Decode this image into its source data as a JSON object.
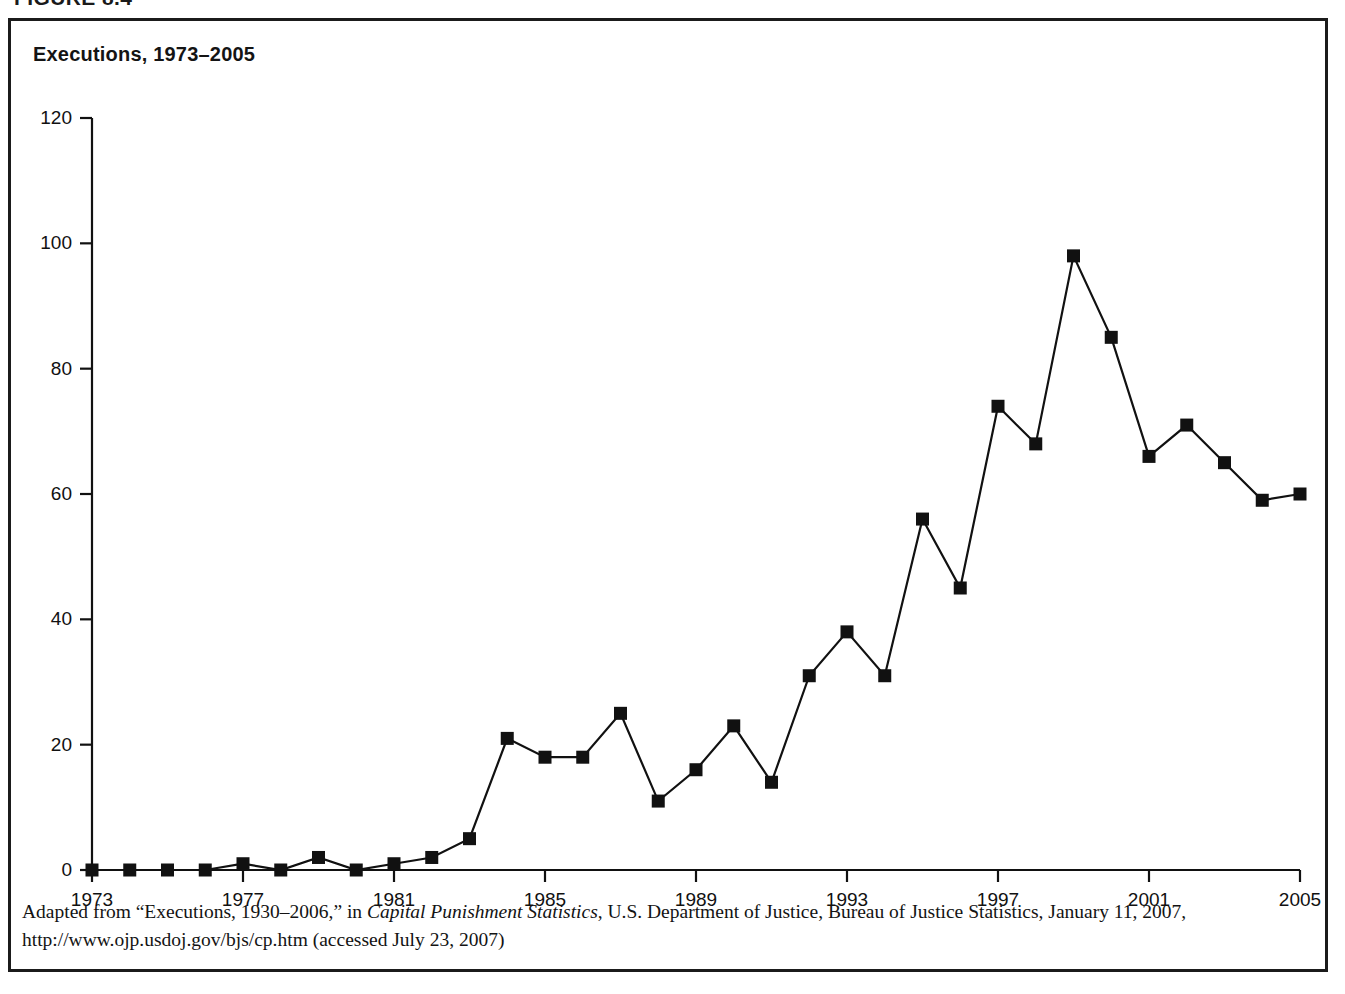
{
  "figure": {
    "number_label": "FIGURE 8.4",
    "title": "Executions, 1973–2005"
  },
  "source_note": {
    "line1_prefix": "Adapted from “Executions, 1930–2006,” in ",
    "line1_italic": "Capital Punishment Statistics",
    "line1_suffix": ", U.S. Department of Justice, Bureau of Justice Statistics, January 11, 2007,",
    "line2": "http://www.ojp.usdoj.gov/bjs/cp.htm (accessed July 23, 2007)"
  },
  "colors": {
    "line": "#111111",
    "marker": "#111111",
    "axis": "#111111",
    "frame": "#1b1b1b",
    "background": "#ffffff"
  },
  "chart_data": {
    "type": "line",
    "title": "Executions, 1973–2005",
    "xlabel": "",
    "ylabel": "",
    "xlim": [
      1973,
      2005
    ],
    "ylim": [
      0,
      120
    ],
    "grid": false,
    "legend": "none",
    "marker": "square",
    "xtick_labels": [
      "1973",
      "1977",
      "1981",
      "1985",
      "1989",
      "1993",
      "1997",
      "2001",
      "2005"
    ],
    "xtick_values": [
      1973,
      1977,
      1981,
      1985,
      1989,
      1993,
      1997,
      2001,
      2005
    ],
    "ytick_labels": [
      "0",
      "20",
      "40",
      "60",
      "80",
      "100",
      "120"
    ],
    "ytick_values": [
      0,
      20,
      40,
      60,
      80,
      100,
      120
    ],
    "x": [
      1973,
      1974,
      1975,
      1976,
      1977,
      1978,
      1979,
      1980,
      1981,
      1982,
      1983,
      1984,
      1985,
      1986,
      1987,
      1988,
      1989,
      1990,
      1991,
      1992,
      1993,
      1994,
      1995,
      1996,
      1997,
      1998,
      1999,
      2000,
      2001,
      2002,
      2003,
      2004,
      2005
    ],
    "values": [
      0,
      0,
      0,
      0,
      1,
      0,
      2,
      0,
      1,
      2,
      5,
      21,
      18,
      18,
      25,
      11,
      16,
      23,
      14,
      31,
      38,
      31,
      56,
      45,
      74,
      68,
      98,
      85,
      66,
      71,
      65,
      59,
      60
    ],
    "series": [
      {
        "name": "Executions",
        "values": [
          0,
          0,
          0,
          0,
          1,
          0,
          2,
          0,
          1,
          2,
          5,
          21,
          18,
          18,
          25,
          11,
          16,
          23,
          14,
          31,
          38,
          31,
          56,
          45,
          74,
          68,
          98,
          85,
          66,
          71,
          65,
          59,
          60
        ]
      }
    ]
  }
}
